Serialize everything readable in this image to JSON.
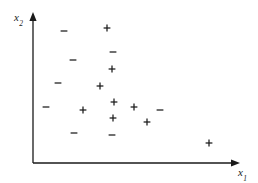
{
  "figure": {
    "width": 258,
    "height": 183,
    "background": "#ffffff",
    "ink_color": "#1a1a1a"
  },
  "axes": {
    "x": {
      "label_base": "x",
      "label_sub": "1",
      "label_full": "x1",
      "origin_x": 33,
      "origin_y": 163,
      "end_x": 240,
      "end_y": 163,
      "arrow": "arrow-right",
      "label_left": 238,
      "label_top": 167
    },
    "y": {
      "label_base": "x",
      "label_sub": "2",
      "label_full": "x2",
      "origin_x": 33,
      "origin_y": 163,
      "end_x": 33,
      "end_y": 12,
      "arrow": "arrow-up",
      "label_left": 14,
      "label_top": 12
    }
  },
  "chart_data": {
    "type": "scatter",
    "title": "",
    "subtitle": "",
    "xlabel": "x1",
    "ylabel": "x2",
    "xlim": [
      33,
      240
    ],
    "ylim": [
      12,
      163
    ],
    "grid": false,
    "legend": "none",
    "axis_style": "arrow-headed, no tick marks, no tick labels",
    "note": "Point coordinates given in pixel space of the 258x183 figure; y increases downward.",
    "series": [
      {
        "name": "+",
        "marker": "plus",
        "color": "#1a1a1a",
        "count": 9,
        "points": [
          {
            "x": 107,
            "y": 28
          },
          {
            "x": 112,
            "y": 69
          },
          {
            "x": 100,
            "y": 86
          },
          {
            "x": 114,
            "y": 102
          },
          {
            "x": 134,
            "y": 107
          },
          {
            "x": 83,
            "y": 110
          },
          {
            "x": 113,
            "y": 118
          },
          {
            "x": 147,
            "y": 122
          },
          {
            "x": 209,
            "y": 143
          }
        ]
      },
      {
        "name": "−",
        "marker": "minus",
        "color": "#1a1a1a",
        "count": 8,
        "points": [
          {
            "x": 64,
            "y": 31
          },
          {
            "x": 113,
            "y": 52
          },
          {
            "x": 73,
            "y": 60
          },
          {
            "x": 58,
            "y": 83
          },
          {
            "x": 46,
            "y": 107
          },
          {
            "x": 160,
            "y": 110
          },
          {
            "x": 74,
            "y": 133
          },
          {
            "x": 112,
            "y": 135
          }
        ]
      }
    ]
  }
}
